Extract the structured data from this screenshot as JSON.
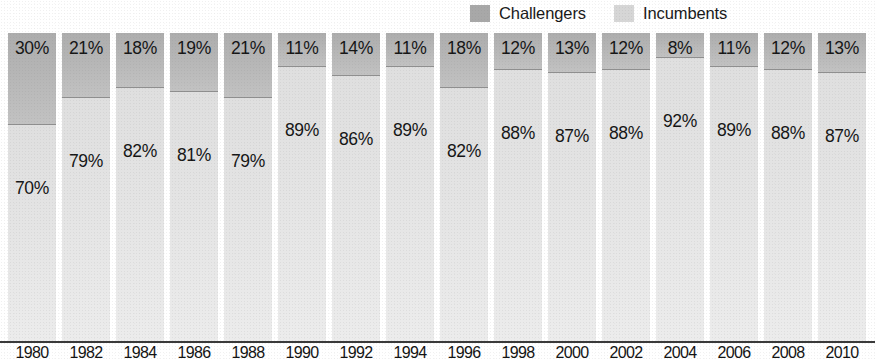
{
  "legend": {
    "entries": [
      {
        "label": "Challengers",
        "color": "#a8a8a8",
        "swatch_name": "legend-swatch-challengers"
      },
      {
        "label": "Incumbents",
        "color": "#d6d6d6",
        "swatch_name": "legend-swatch-incumbents"
      }
    ]
  },
  "chart_data": {
    "type": "bar",
    "subtype": "100% stacked bar",
    "title": "",
    "subtitle": "",
    "xlabel": "",
    "ylabel": "",
    "ylim": [
      0,
      100
    ],
    "grid": false,
    "legend_position": "top-right",
    "value_suffix": "%",
    "categories": [
      "1980",
      "1982",
      "1984",
      "1986",
      "1988",
      "1990",
      "1992",
      "1994",
      "1996",
      "1998",
      "2000",
      "2002",
      "2004",
      "2006",
      "2008",
      "2010"
    ],
    "series": [
      {
        "name": "Challengers",
        "color": "#b3b3b3",
        "stack_position": "top",
        "values": [
          30,
          21,
          18,
          19,
          21,
          11,
          14,
          11,
          18,
          12,
          13,
          12,
          8,
          11,
          12,
          13
        ],
        "labels": [
          "30%",
          "21%",
          "18%",
          "19%",
          "21%",
          "11%",
          "14%",
          "11%",
          "18%",
          "12%",
          "13%",
          "12%",
          "8%",
          "11%",
          "12%",
          "13%"
        ]
      },
      {
        "name": "Incumbents",
        "color": "#e3e3e3",
        "stack_position": "bottom",
        "values": [
          70,
          79,
          82,
          81,
          79,
          89,
          86,
          89,
          82,
          88,
          87,
          88,
          92,
          89,
          88,
          87
        ],
        "labels": [
          "70%",
          "79%",
          "82%",
          "81%",
          "79%",
          "89%",
          "86%",
          "89%",
          "82%",
          "88%",
          "87%",
          "88%",
          "92%",
          "89%",
          "88%",
          "87%"
        ]
      }
    ]
  }
}
